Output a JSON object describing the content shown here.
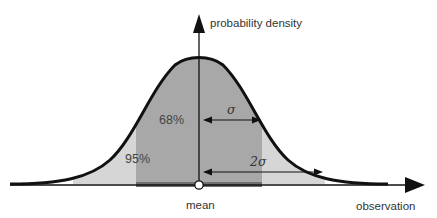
{
  "diagram": {
    "type": "normal-distribution",
    "axes": {
      "y_label": "probability density",
      "x_label": "observation"
    },
    "center_label": "mean",
    "regions": [
      {
        "name": "one-sigma",
        "percent_label": "68%",
        "span_sigma": 1,
        "color": "#a8a8a8"
      },
      {
        "name": "two-sigma",
        "percent_label": "95%",
        "span_sigma": 2,
        "color": "#d6d6d6"
      }
    ],
    "intervals": [
      {
        "label": "σ",
        "prefix": "",
        "symbol": "σ"
      },
      {
        "label": "2σ",
        "prefix": "2",
        "symbol": "σ"
      }
    ],
    "colors": {
      "curve": "#111111",
      "axis": "#111111",
      "inner_band": "#a8a8a8",
      "outer_band": "#d6d6d6",
      "baseline_strip": "#707070",
      "mean_marker": "#ffffff"
    }
  }
}
